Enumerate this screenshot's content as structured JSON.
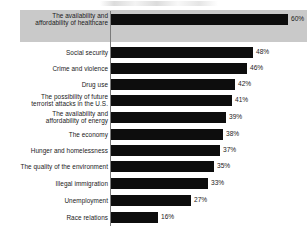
{
  "chart_data": {
    "type": "bar",
    "orientation": "horizontal",
    "title": "",
    "subtitle": "",
    "xlabel": "",
    "ylabel": "",
    "xlim": [
      0,
      65
    ],
    "grid": false,
    "legend": null,
    "value_suffix": "%",
    "highlighted_category": "The availability and affordability of healthcare",
    "categories": [
      "The availability and\naffordability of healthcare",
      "Social security",
      "Crime and violence",
      "Drug use",
      "The possibility of future\nterrorist attacks in the U.S.",
      "The availability and\naffordability of energy",
      "The economy",
      "Hunger and homelessness",
      "The quality of the environment",
      "Illegal immigration",
      "Unemployment",
      "Race relations"
    ],
    "values": [
      60,
      48,
      46,
      42,
      41,
      39,
      38,
      37,
      35,
      33,
      27,
      16
    ],
    "value_labels": [
      "60%",
      "48%",
      "46%",
      "42%",
      "41%",
      "39%",
      "38%",
      "37%",
      "35%",
      "33%",
      "27%",
      "16%"
    ],
    "colors": {
      "bar": "#0d0d0d",
      "background": "#ffffff",
      "highlight_band": "#c9c9c9",
      "axis": "#7a7a7a",
      "text": "#1a1a1a"
    }
  },
  "rows": [
    {
      "label": "The availability and\naffordability of healthcare",
      "value": 60,
      "value_label": "60%",
      "top": 12,
      "two_line": true,
      "highlighted": true
    },
    {
      "label": "Social security",
      "value": 48,
      "value_label": "48%",
      "top": 45,
      "two_line": false,
      "highlighted": false
    },
    {
      "label": "Crime and violence",
      "value": 46,
      "value_label": "46%",
      "top": 61,
      "two_line": false,
      "highlighted": false
    },
    {
      "label": "Drug use",
      "value": 42,
      "value_label": "42%",
      "top": 77,
      "two_line": false,
      "highlighted": false
    },
    {
      "label": "The possibility of future\nterrorist attacks in the U.S.",
      "value": 41,
      "value_label": "41%",
      "top": 93,
      "two_line": true,
      "highlighted": false
    },
    {
      "label": "The availability and\naffordability of energy",
      "value": 39,
      "value_label": "39%",
      "top": 110,
      "two_line": true,
      "highlighted": false
    },
    {
      "label": "The economy",
      "value": 38,
      "value_label": "38%",
      "top": 127,
      "two_line": false,
      "highlighted": false
    },
    {
      "label": "Hunger and homelessness",
      "value": 37,
      "value_label": "37%",
      "top": 143,
      "two_line": false,
      "highlighted": false
    },
    {
      "label": "The quality of the environment",
      "value": 35,
      "value_label": "35%",
      "top": 159,
      "two_line": false,
      "highlighted": false
    },
    {
      "label": "Illegal immigration",
      "value": 33,
      "value_label": "33%",
      "top": 176,
      "two_line": false,
      "highlighted": false
    },
    {
      "label": "Unemployment",
      "value": 27,
      "value_label": "27%",
      "top": 193,
      "two_line": false,
      "highlighted": false
    },
    {
      "label": "Race relations",
      "value": 16,
      "value_label": "16%",
      "top": 210,
      "two_line": false,
      "highlighted": false
    }
  ],
  "scale": {
    "origin_x": 111,
    "px_per_unit": 2.95
  }
}
